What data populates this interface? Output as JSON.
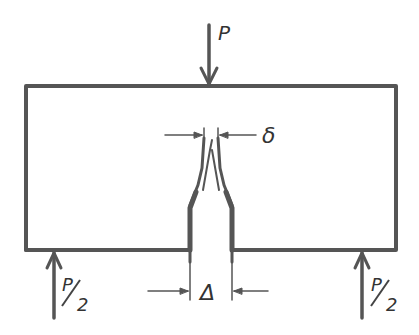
{
  "diagram": {
    "type": "mechanics-free-body",
    "labels": {
      "top_load": "P",
      "left_reaction_num": "P",
      "left_reaction_den": "2",
      "right_reaction_num": "P",
      "right_reaction_den": "2",
      "tip_gap": "δ",
      "base_gap": "Δ"
    },
    "colors": {
      "stroke": "#555555",
      "background": "#ffffff"
    }
  }
}
